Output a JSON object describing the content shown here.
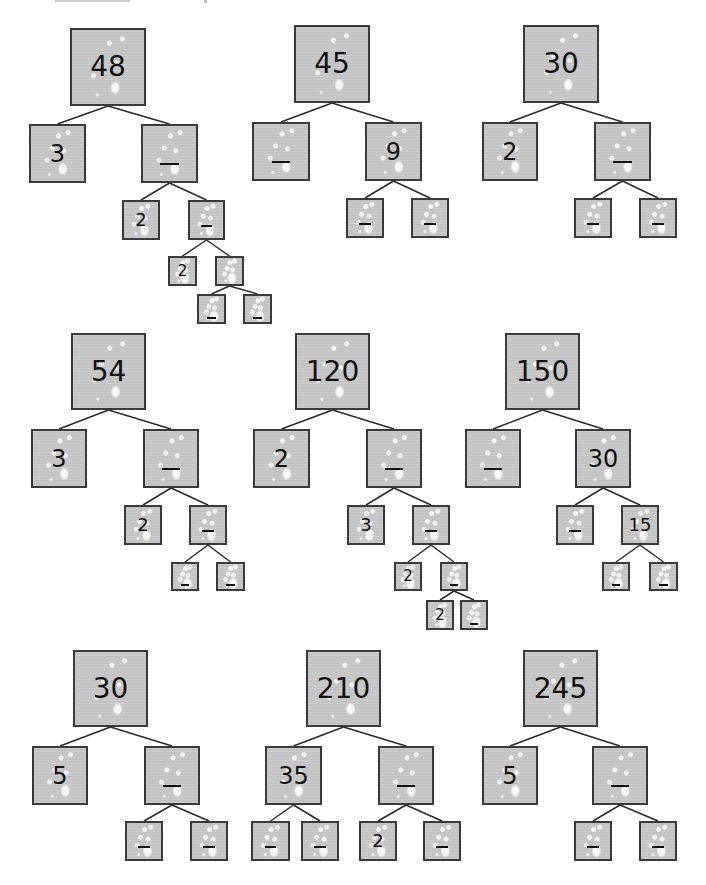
{
  "worksheet": {
    "title_fragment_visible": "",
    "instructions_visible": false,
    "box_color": "#c9c9c9",
    "border_color": "#3a3a3a",
    "blank_marker": "_",
    "trees": [
      {
        "root": "48",
        "nodes": [
          {
            "id": "t1n0",
            "value": "48",
            "x": 70,
            "y": 28,
            "w": 76,
            "h": 78,
            "size": "root"
          },
          {
            "id": "t1n1",
            "value": "3",
            "x": 29,
            "y": 124,
            "w": 57,
            "h": 59,
            "size": "mid"
          },
          {
            "id": "t1n2",
            "value": "",
            "x": 141,
            "y": 124,
            "w": 57,
            "h": 59,
            "size": "mid"
          },
          {
            "id": "t1n3",
            "value": "2",
            "x": 122,
            "y": 200,
            "w": 38,
            "h": 40,
            "size": "sm"
          },
          {
            "id": "t1n4",
            "value": "",
            "x": 188,
            "y": 200,
            "w": 37,
            "h": 40,
            "size": "sm"
          },
          {
            "id": "t1n5",
            "value": "2",
            "x": 168,
            "y": 256,
            "w": 29,
            "h": 30,
            "size": "xs"
          },
          {
            "id": "t1n6",
            "value": "",
            "x": 215,
            "y": 256,
            "w": 29,
            "h": 30,
            "size": "xs",
            "nomark": true
          },
          {
            "id": "t1n7",
            "value": "",
            "x": 197,
            "y": 294,
            "w": 29,
            "h": 30,
            "size": "xs",
            "low": true
          },
          {
            "id": "t1n8",
            "value": "",
            "x": 243,
            "y": 294,
            "w": 29,
            "h": 30,
            "size": "xs",
            "low": true
          }
        ],
        "edges": [
          [
            "t1n0",
            "t1n1"
          ],
          [
            "t1n0",
            "t1n2"
          ],
          [
            "t1n2",
            "t1n3"
          ],
          [
            "t1n2",
            "t1n4"
          ],
          [
            "t1n4",
            "t1n5"
          ],
          [
            "t1n4",
            "t1n6"
          ],
          [
            "t1n6",
            "t1n7"
          ],
          [
            "t1n6",
            "t1n8"
          ]
        ]
      },
      {
        "root": "45",
        "nodes": [
          {
            "id": "t2n0",
            "value": "45",
            "x": 294,
            "y": 25,
            "w": 76,
            "h": 78,
            "size": "root"
          },
          {
            "id": "t2n1",
            "value": "",
            "x": 252,
            "y": 122,
            "w": 58,
            "h": 59,
            "size": "mid"
          },
          {
            "id": "t2n2",
            "value": "9",
            "x": 365,
            "y": 122,
            "w": 57,
            "h": 59,
            "size": "mid"
          },
          {
            "id": "t2n3",
            "value": "",
            "x": 346,
            "y": 198,
            "w": 38,
            "h": 40,
            "size": "sm"
          },
          {
            "id": "t2n4",
            "value": "",
            "x": 411,
            "y": 198,
            "w": 38,
            "h": 40,
            "size": "sm"
          }
        ],
        "edges": [
          [
            "t2n0",
            "t2n1"
          ],
          [
            "t2n0",
            "t2n2"
          ],
          [
            "t2n2",
            "t2n3"
          ],
          [
            "t2n2",
            "t2n4"
          ]
        ]
      },
      {
        "root": "30",
        "nodes": [
          {
            "id": "t3n0",
            "value": "30",
            "x": 523,
            "y": 25,
            "w": 76,
            "h": 78,
            "size": "root"
          },
          {
            "id": "t3n1",
            "value": "2",
            "x": 482,
            "y": 122,
            "w": 56,
            "h": 59,
            "size": "mid"
          },
          {
            "id": "t3n2",
            "value": "",
            "x": 594,
            "y": 122,
            "w": 57,
            "h": 59,
            "size": "mid"
          },
          {
            "id": "t3n3",
            "value": "",
            "x": 574,
            "y": 198,
            "w": 38,
            "h": 40,
            "size": "sm"
          },
          {
            "id": "t3n4",
            "value": "",
            "x": 639,
            "y": 198,
            "w": 38,
            "h": 40,
            "size": "sm"
          }
        ],
        "edges": [
          [
            "t3n0",
            "t3n1"
          ],
          [
            "t3n0",
            "t3n2"
          ],
          [
            "t3n2",
            "t3n3"
          ],
          [
            "t3n2",
            "t3n4"
          ]
        ]
      },
      {
        "root": "54",
        "nodes": [
          {
            "id": "t4n0",
            "value": "54",
            "x": 71,
            "y": 333,
            "w": 75,
            "h": 77,
            "size": "root"
          },
          {
            "id": "t4n1",
            "value": "3",
            "x": 31,
            "y": 429,
            "w": 56,
            "h": 59,
            "size": "mid"
          },
          {
            "id": "t4n2",
            "value": "",
            "x": 143,
            "y": 429,
            "w": 56,
            "h": 59,
            "size": "mid"
          },
          {
            "id": "t4n3",
            "value": "2",
            "x": 124,
            "y": 505,
            "w": 38,
            "h": 40,
            "size": "sm"
          },
          {
            "id": "t4n4",
            "value": "",
            "x": 189,
            "y": 505,
            "w": 38,
            "h": 40,
            "size": "sm"
          },
          {
            "id": "t4n5",
            "value": "",
            "x": 171,
            "y": 562,
            "w": 28,
            "h": 29,
            "size": "xs",
            "low": true
          },
          {
            "id": "t4n6",
            "value": "",
            "x": 216,
            "y": 562,
            "w": 29,
            "h": 29,
            "size": "xs",
            "low": true
          }
        ],
        "edges": [
          [
            "t4n0",
            "t4n1"
          ],
          [
            "t4n0",
            "t4n2"
          ],
          [
            "t4n2",
            "t4n3"
          ],
          [
            "t4n2",
            "t4n4"
          ],
          [
            "t4n4",
            "t4n5"
          ],
          [
            "t4n4",
            "t4n6"
          ]
        ]
      },
      {
        "root": "120",
        "nodes": [
          {
            "id": "t5n0",
            "value": "120",
            "x": 295,
            "y": 333,
            "w": 75,
            "h": 77,
            "size": "root"
          },
          {
            "id": "t5n1",
            "value": "2",
            "x": 253,
            "y": 429,
            "w": 57,
            "h": 59,
            "size": "mid"
          },
          {
            "id": "t5n2",
            "value": "",
            "x": 366,
            "y": 429,
            "w": 56,
            "h": 59,
            "size": "mid"
          },
          {
            "id": "t5n3",
            "value": "3",
            "x": 347,
            "y": 505,
            "w": 38,
            "h": 40,
            "size": "sm"
          },
          {
            "id": "t5n4",
            "value": "",
            "x": 412,
            "y": 505,
            "w": 38,
            "h": 40,
            "size": "sm"
          },
          {
            "id": "t5n5",
            "value": "2",
            "x": 394,
            "y": 562,
            "w": 28,
            "h": 29,
            "size": "xs"
          },
          {
            "id": "t5n6",
            "value": "",
            "x": 440,
            "y": 562,
            "w": 28,
            "h": 29,
            "size": "xs",
            "low": true
          },
          {
            "id": "t5n7",
            "value": "2",
            "x": 426,
            "y": 600,
            "w": 28,
            "h": 30,
            "size": "xs"
          },
          {
            "id": "t5n8",
            "value": "",
            "x": 460,
            "y": 600,
            "w": 28,
            "h": 30,
            "size": "xs",
            "low": true
          }
        ],
        "edges": [
          [
            "t5n0",
            "t5n1"
          ],
          [
            "t5n0",
            "t5n2"
          ],
          [
            "t5n2",
            "t5n3"
          ],
          [
            "t5n2",
            "t5n4"
          ],
          [
            "t5n4",
            "t5n5"
          ],
          [
            "t5n4",
            "t5n6"
          ],
          [
            "t5n6",
            "t5n7"
          ],
          [
            "t5n6",
            "t5n8"
          ]
        ]
      },
      {
        "root": "150",
        "nodes": [
          {
            "id": "t6n0",
            "value": "150",
            "x": 505,
            "y": 333,
            "w": 75,
            "h": 77,
            "size": "root"
          },
          {
            "id": "t6n1",
            "value": "",
            "x": 465,
            "y": 429,
            "w": 56,
            "h": 59,
            "size": "mid"
          },
          {
            "id": "t6n2",
            "value": "30",
            "x": 575,
            "y": 429,
            "w": 56,
            "h": 59,
            "size": "mid"
          },
          {
            "id": "t6n3",
            "value": "",
            "x": 556,
            "y": 505,
            "w": 38,
            "h": 40,
            "size": "sm"
          },
          {
            "id": "t6n4",
            "value": "15",
            "x": 621,
            "y": 505,
            "w": 38,
            "h": 40,
            "size": "sm"
          },
          {
            "id": "t6n5",
            "value": "",
            "x": 602,
            "y": 562,
            "w": 28,
            "h": 29,
            "size": "xs",
            "low": true
          },
          {
            "id": "t6n6",
            "value": "",
            "x": 649,
            "y": 562,
            "w": 29,
            "h": 29,
            "size": "xs",
            "low": true
          }
        ],
        "edges": [
          [
            "t6n0",
            "t6n1"
          ],
          [
            "t6n0",
            "t6n2"
          ],
          [
            "t6n2",
            "t6n3"
          ],
          [
            "t6n2",
            "t6n4"
          ],
          [
            "t6n4",
            "t6n5"
          ],
          [
            "t6n4",
            "t6n6"
          ]
        ]
      },
      {
        "root": "30",
        "nodes": [
          {
            "id": "t7n0",
            "value": "30",
            "x": 73,
            "y": 650,
            "w": 75,
            "h": 77,
            "size": "root"
          },
          {
            "id": "t7n1",
            "value": "5",
            "x": 32,
            "y": 746,
            "w": 56,
            "h": 59,
            "size": "mid"
          },
          {
            "id": "t7n2",
            "value": "",
            "x": 144,
            "y": 746,
            "w": 56,
            "h": 59,
            "size": "mid"
          },
          {
            "id": "t7n3",
            "value": "",
            "x": 125,
            "y": 821,
            "w": 38,
            "h": 40,
            "size": "sm"
          },
          {
            "id": "t7n4",
            "value": "",
            "x": 190,
            "y": 821,
            "w": 38,
            "h": 40,
            "size": "sm"
          }
        ],
        "edges": [
          [
            "t7n0",
            "t7n1"
          ],
          [
            "t7n0",
            "t7n2"
          ],
          [
            "t7n2",
            "t7n3"
          ],
          [
            "t7n2",
            "t7n4"
          ]
        ]
      },
      {
        "root": "210",
        "nodes": [
          {
            "id": "t8n0",
            "value": "210",
            "x": 306,
            "y": 650,
            "w": 75,
            "h": 77,
            "size": "root"
          },
          {
            "id": "t8n1",
            "value": "35",
            "x": 265,
            "y": 746,
            "w": 57,
            "h": 59,
            "size": "mid"
          },
          {
            "id": "t8n2",
            "value": "",
            "x": 378,
            "y": 746,
            "w": 56,
            "h": 59,
            "size": "mid"
          },
          {
            "id": "t8n3",
            "value": "",
            "x": 251,
            "y": 821,
            "w": 39,
            "h": 40,
            "size": "sm"
          },
          {
            "id": "t8n4",
            "value": "",
            "x": 301,
            "y": 821,
            "w": 38,
            "h": 40,
            "size": "sm"
          },
          {
            "id": "t8n5",
            "value": "2",
            "x": 359,
            "y": 821,
            "w": 38,
            "h": 40,
            "size": "sm"
          },
          {
            "id": "t8n6",
            "value": "",
            "x": 423,
            "y": 821,
            "w": 38,
            "h": 40,
            "size": "sm"
          }
        ],
        "edges": [
          [
            "t8n0",
            "t8n1"
          ],
          [
            "t8n0",
            "t8n2"
          ],
          [
            "t8n1",
            "t8n3"
          ],
          [
            "t8n1",
            "t8n4"
          ],
          [
            "t8n2",
            "t8n5"
          ],
          [
            "t8n2",
            "t8n6"
          ]
        ]
      },
      {
        "root": "245",
        "nodes": [
          {
            "id": "t9n0",
            "value": "245",
            "x": 523,
            "y": 650,
            "w": 75,
            "h": 77,
            "size": "root"
          },
          {
            "id": "t9n1",
            "value": "5",
            "x": 482,
            "y": 746,
            "w": 56,
            "h": 59,
            "size": "mid"
          },
          {
            "id": "t9n2",
            "value": "",
            "x": 592,
            "y": 746,
            "w": 56,
            "h": 59,
            "size": "mid"
          },
          {
            "id": "t9n3",
            "value": "",
            "x": 574,
            "y": 821,
            "w": 38,
            "h": 40,
            "size": "sm"
          },
          {
            "id": "t9n4",
            "value": "",
            "x": 639,
            "y": 821,
            "w": 38,
            "h": 40,
            "size": "sm"
          }
        ],
        "edges": [
          [
            "t9n0",
            "t9n1"
          ],
          [
            "t9n0",
            "t9n2"
          ],
          [
            "t9n2",
            "t9n3"
          ],
          [
            "t9n2",
            "t9n4"
          ]
        ]
      }
    ]
  }
}
